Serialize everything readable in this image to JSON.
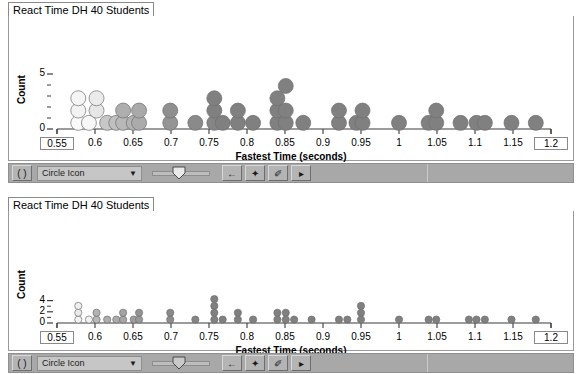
{
  "panels": [
    {
      "id": "panel-top",
      "tab_title": "React Time DH 40 Students",
      "toolbar": {
        "paren_button_label": "( )",
        "icon_select_value": "Circle Icon",
        "dropdown_arrow": "▼",
        "back_button_label": "←",
        "point_button_label": "✦",
        "pen_button_label": "✐",
        "play_button_label": "▸"
      },
      "chart_ref": 0
    },
    {
      "id": "panel-bottom",
      "tab_title": "React Time DH 40 Students",
      "toolbar": {
        "paren_button_label": "( )",
        "icon_select_value": "Circle Icon",
        "dropdown_arrow": "▼",
        "back_button_label": "←",
        "point_button_label": "✦",
        "pen_button_label": "✐",
        "play_button_label": "▸"
      },
      "chart_ref": 1
    }
  ],
  "chart_data": [
    {
      "type": "scatter",
      "variant": "dotplot",
      "title": "React Time DH 40 Students",
      "xlabel": "Fastest Time (seconds)",
      "ylabel": "Count",
      "xlim": [
        0.55,
        1.2
      ],
      "ylim": [
        0,
        5.6
      ],
      "grid": false,
      "legend": null,
      "dot_radius_px": 7.5,
      "y_ticks_major": [
        0,
        5
      ],
      "y_ticks_minor": [
        1,
        2,
        3,
        4
      ],
      "y_tick_labels": [
        "0",
        "5"
      ],
      "x_ticks": [
        0.55,
        0.6,
        0.65,
        0.7,
        0.75,
        0.8,
        0.85,
        0.9,
        0.95,
        1.0,
        1.05,
        1.1,
        1.15,
        1.2
      ],
      "x_tick_labels": [
        "0.55",
        "0.6",
        "0.65",
        "0.7",
        "0.75",
        "0.8",
        "0.85",
        "0.9",
        "0.95",
        "1",
        "1.05",
        "1.1",
        "1.15",
        "1.2"
      ],
      "x_tick_labels_boxed": [
        "0.55",
        "1.2"
      ],
      "points": [
        {
          "x": 0.578,
          "stack": 1,
          "shade": 0.02
        },
        {
          "x": 0.578,
          "stack": 2,
          "shade": 0.05
        },
        {
          "x": 0.578,
          "stack": 3,
          "shade": 0.04
        },
        {
          "x": 0.592,
          "stack": 1,
          "shade": 0.03
        },
        {
          "x": 0.602,
          "stack": 2,
          "shade": 0.1
        },
        {
          "x": 0.602,
          "stack": 3,
          "shade": 0.08
        },
        {
          "x": 0.616,
          "stack": 1,
          "shade": 0.22
        },
        {
          "x": 0.628,
          "stack": 1,
          "shade": 0.25
        },
        {
          "x": 0.637,
          "stack": 1,
          "shade": 0.28
        },
        {
          "x": 0.637,
          "stack": 2,
          "shade": 0.32
        },
        {
          "x": 0.651,
          "stack": 1,
          "shade": 0.3
        },
        {
          "x": 0.658,
          "stack": 1,
          "shade": 0.33
        },
        {
          "x": 0.658,
          "stack": 2,
          "shade": 0.34
        },
        {
          "x": 0.699,
          "stack": 1,
          "shade": 0.42
        },
        {
          "x": 0.699,
          "stack": 2,
          "shade": 0.44
        },
        {
          "x": 0.732,
          "stack": 1,
          "shade": 0.46
        },
        {
          "x": 0.757,
          "stack": 1,
          "shade": 0.48
        },
        {
          "x": 0.757,
          "stack": 2,
          "shade": 0.5
        },
        {
          "x": 0.757,
          "stack": 3,
          "shade": 0.5
        },
        {
          "x": 0.768,
          "stack": 1,
          "shade": 0.5
        },
        {
          "x": 0.788,
          "stack": 1,
          "shade": 0.5
        },
        {
          "x": 0.788,
          "stack": 2,
          "shade": 0.5
        },
        {
          "x": 0.808,
          "stack": 1,
          "shade": 0.5
        },
        {
          "x": 0.84,
          "stack": 1,
          "shade": 0.5
        },
        {
          "x": 0.84,
          "stack": 2,
          "shade": 0.5
        },
        {
          "x": 0.84,
          "stack": 3,
          "shade": 0.5
        },
        {
          "x": 0.851,
          "stack": 1,
          "shade": 0.5
        },
        {
          "x": 0.851,
          "stack": 2,
          "shade": 0.5
        },
        {
          "x": 0.851,
          "stack": 4,
          "shade": 0.5
        },
        {
          "x": 0.874,
          "stack": 1,
          "shade": 0.5
        },
        {
          "x": 0.921,
          "stack": 1,
          "shade": 0.5
        },
        {
          "x": 0.921,
          "stack": 2,
          "shade": 0.5
        },
        {
          "x": 0.944,
          "stack": 1,
          "shade": 0.5
        },
        {
          "x": 0.952,
          "stack": 1,
          "shade": 0.5
        },
        {
          "x": 0.952,
          "stack": 2,
          "shade": 0.5
        },
        {
          "x": 1.0,
          "stack": 1,
          "shade": 0.5
        },
        {
          "x": 1.039,
          "stack": 1,
          "shade": 0.5
        },
        {
          "x": 1.049,
          "stack": 1,
          "shade": 0.5
        },
        {
          "x": 1.049,
          "stack": 2,
          "shade": 0.5
        },
        {
          "x": 1.081,
          "stack": 1,
          "shade": 0.5
        },
        {
          "x": 1.102,
          "stack": 1,
          "shade": 0.5
        },
        {
          "x": 1.113,
          "stack": 1,
          "shade": 0.5
        },
        {
          "x": 1.148,
          "stack": 1,
          "shade": 0.5
        },
        {
          "x": 1.18,
          "stack": 1,
          "shade": 0.5
        }
      ]
    },
    {
      "type": "scatter",
      "variant": "dotplot",
      "title": "React Time DH 40 Students",
      "xlabel": "Fastest Time (seconds)",
      "ylabel": "Count",
      "xlim": [
        0.55,
        1.2
      ],
      "ylim": [
        0,
        4.8
      ],
      "grid": false,
      "legend": null,
      "dot_radius_px": 3.6,
      "y_ticks_major": [
        0,
        2,
        4
      ],
      "y_ticks_minor": [
        1,
        3
      ],
      "y_tick_labels": [
        "0",
        "2",
        "4"
      ],
      "x_ticks": [
        0.55,
        0.6,
        0.65,
        0.7,
        0.75,
        0.8,
        0.85,
        0.9,
        0.95,
        1.0,
        1.05,
        1.1,
        1.15,
        1.2
      ],
      "x_tick_labels": [
        "0.55",
        "0.6",
        "0.65",
        "0.7",
        "0.75",
        "0.8",
        "0.85",
        "0.9",
        "0.95",
        "1",
        "1.05",
        "1.1",
        "1.15",
        "1.2"
      ],
      "x_tick_labels_boxed": [
        "0.55",
        "1.2"
      ],
      "points": [
        {
          "x": 0.578,
          "stack": 1,
          "shade": 0.05
        },
        {
          "x": 0.578,
          "stack": 2,
          "shade": 0.08
        },
        {
          "x": 0.578,
          "stack": 3,
          "shade": 0.06
        },
        {
          "x": 0.592,
          "stack": 1,
          "shade": 0.05
        },
        {
          "x": 0.602,
          "stack": 1,
          "shade": 0.28
        },
        {
          "x": 0.602,
          "stack": 2,
          "shade": 0.3
        },
        {
          "x": 0.616,
          "stack": 1,
          "shade": 0.32
        },
        {
          "x": 0.628,
          "stack": 1,
          "shade": 0.33
        },
        {
          "x": 0.637,
          "stack": 1,
          "shade": 0.35
        },
        {
          "x": 0.637,
          "stack": 2,
          "shade": 0.36
        },
        {
          "x": 0.651,
          "stack": 1,
          "shade": 0.38
        },
        {
          "x": 0.658,
          "stack": 1,
          "shade": 0.4
        },
        {
          "x": 0.658,
          "stack": 2,
          "shade": 0.42
        },
        {
          "x": 0.699,
          "stack": 1,
          "shade": 0.45
        },
        {
          "x": 0.699,
          "stack": 2,
          "shade": 0.46
        },
        {
          "x": 0.732,
          "stack": 1,
          "shade": 0.48
        },
        {
          "x": 0.757,
          "stack": 1,
          "shade": 0.5
        },
        {
          "x": 0.757,
          "stack": 2,
          "shade": 0.5
        },
        {
          "x": 0.757,
          "stack": 3,
          "shade": 0.5
        },
        {
          "x": 0.757,
          "stack": 4,
          "shade": 0.5
        },
        {
          "x": 0.768,
          "stack": 1,
          "shade": 0.5
        },
        {
          "x": 0.788,
          "stack": 1,
          "shade": 0.5
        },
        {
          "x": 0.788,
          "stack": 2,
          "shade": 0.5
        },
        {
          "x": 0.808,
          "stack": 1,
          "shade": 0.5
        },
        {
          "x": 0.84,
          "stack": 1,
          "shade": 0.5
        },
        {
          "x": 0.84,
          "stack": 2,
          "shade": 0.5
        },
        {
          "x": 0.851,
          "stack": 1,
          "shade": 0.5
        },
        {
          "x": 0.851,
          "stack": 2,
          "shade": 0.5
        },
        {
          "x": 0.862,
          "stack": 1,
          "shade": 0.5
        },
        {
          "x": 0.885,
          "stack": 1,
          "shade": 0.5
        },
        {
          "x": 0.921,
          "stack": 1,
          "shade": 0.5
        },
        {
          "x": 0.932,
          "stack": 1,
          "shade": 0.5
        },
        {
          "x": 0.95,
          "stack": 1,
          "shade": 0.5
        },
        {
          "x": 0.95,
          "stack": 2,
          "shade": 0.5
        },
        {
          "x": 0.95,
          "stack": 3,
          "shade": 0.5
        },
        {
          "x": 1.0,
          "stack": 1,
          "shade": 0.5
        },
        {
          "x": 1.039,
          "stack": 1,
          "shade": 0.5
        },
        {
          "x": 1.049,
          "stack": 1,
          "shade": 0.5
        },
        {
          "x": 1.092,
          "stack": 1,
          "shade": 0.5
        },
        {
          "x": 1.102,
          "stack": 1,
          "shade": 0.5
        },
        {
          "x": 1.113,
          "stack": 1,
          "shade": 0.5
        },
        {
          "x": 1.148,
          "stack": 1,
          "shade": 0.5
        },
        {
          "x": 1.18,
          "stack": 1,
          "shade": 0.5
        }
      ]
    }
  ],
  "colors": {
    "dot_light": "#ffffff",
    "dot_dark": "#808080",
    "dot_stroke": "#6f6f6f",
    "axis": "#3a3a3a",
    "toolbar_bg": "#a8a8a8",
    "frame_border": "#9a9a9a"
  }
}
